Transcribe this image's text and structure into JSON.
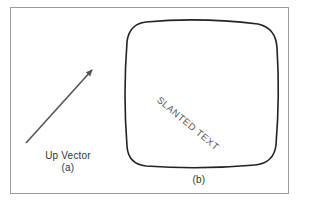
{
  "figure": {
    "panel_a": {
      "label": "Up Vector",
      "caption": "(a)",
      "arrow": {
        "x1": 26,
        "y1": 143,
        "x2": 94,
        "y2": 68,
        "color": "#555555"
      }
    },
    "panel_b": {
      "caption": "(b)",
      "slanted_text": "SLANTED TEXT",
      "slant_angle_deg": 40,
      "box_color": "#222222"
    },
    "frame_color": "#9a9a9a"
  }
}
